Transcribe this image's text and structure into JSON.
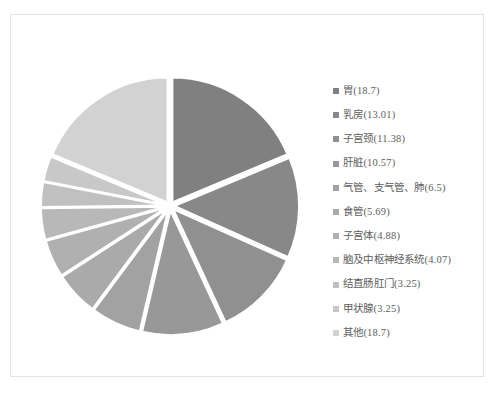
{
  "chart_data": {
    "type": "pie",
    "title": "",
    "subtitle": "",
    "xlabel": "",
    "ylabel": "",
    "legend_position": "right",
    "grid": false,
    "exploded": true,
    "start_angle_deg": 0,
    "direction": "clockwise",
    "units": "percent",
    "categories": [
      "胃",
      "乳房",
      "子宫颈",
      "肝脏",
      "气管、支气管、肺",
      "食管",
      "子宫体",
      "脑及中枢神经系统",
      "结直肠肛门",
      "甲状腺",
      "其他"
    ],
    "values": [
      18.7,
      13.01,
      11.38,
      10.57,
      6.5,
      5.69,
      4.88,
      4.07,
      3.25,
      3.25,
      18.7
    ],
    "colors": [
      "#808080",
      "#888888",
      "#909090",
      "#989898",
      "#a2a2a2",
      "#aaaaaa",
      "#b0b0b0",
      "#b8b8b8",
      "#c0c0c0",
      "#c8c8c8",
      "#d2d2d2"
    ],
    "slice_separator_color": "#ffffff",
    "background_color": "#ffffff",
    "border_color": "#e3e3e3"
  },
  "legend": {
    "items": [
      {
        "label": "胃(18.7)",
        "value": 18.7,
        "name": "胃",
        "color": "#808080"
      },
      {
        "label": "乳房(13.01)",
        "value": 13.01,
        "name": "乳房",
        "color": "#888888"
      },
      {
        "label": "子宫颈(11.38)",
        "value": 11.38,
        "name": "子宫颈",
        "color": "#909090"
      },
      {
        "label": "肝脏(10.57)",
        "value": 10.57,
        "name": "肝脏",
        "color": "#989898"
      },
      {
        "label": "气管、支气管、肺(6.5)",
        "value": 6.5,
        "name": "气管、支气管、肺",
        "color": "#a2a2a2"
      },
      {
        "label": "食管(5.69)",
        "value": 5.69,
        "name": "食管",
        "color": "#aaaaaa"
      },
      {
        "label": "子宫体(4.88)",
        "value": 4.88,
        "name": "子宫体",
        "color": "#b0b0b0"
      },
      {
        "label": "脑及中枢神经系统(4.07)",
        "value": 4.07,
        "name": "脑及中枢神经系统",
        "color": "#b8b8b8"
      },
      {
        "label": "结直肠肛门(3.25)",
        "value": 3.25,
        "name": "结直肠肛门",
        "color": "#c0c0c0"
      },
      {
        "label": "甲状腺(3.25)",
        "value": 3.25,
        "name": "甲状腺",
        "color": "#c8c8c8"
      },
      {
        "label": "其他(18.7)",
        "value": 18.7,
        "name": "其他",
        "color": "#d2d2d2"
      }
    ]
  }
}
